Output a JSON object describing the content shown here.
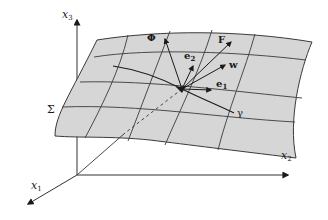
{
  "diagram": {
    "type": "surface-in-3d-coordinate-system",
    "axes": {
      "x1": {
        "label": "x",
        "sub": "1"
      },
      "x2": {
        "label": "x",
        "sub": "2"
      },
      "x3": {
        "label": "x",
        "sub": "3"
      }
    },
    "surface": {
      "label": "Σ",
      "fill": "#d6d6d6",
      "stroke": "#3a3a3a"
    },
    "vectors": [
      {
        "id": "Phi",
        "label": "Φ"
      },
      {
        "id": "F",
        "label": "F"
      },
      {
        "id": "e2",
        "label": "e",
        "sub": "2"
      },
      {
        "id": "w",
        "label": "w"
      },
      {
        "id": "e1",
        "label": "e",
        "sub": "1"
      }
    ],
    "curve": {
      "label": "γ"
    },
    "colors": {
      "ink": "#1a1a1a",
      "surface": "#d6d6d6",
      "background": "#ffffff"
    }
  }
}
